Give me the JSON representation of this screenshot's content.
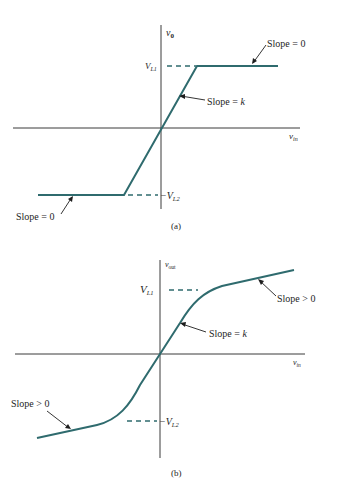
{
  "figure_a": {
    "caption": "(a)",
    "y_axis_label": "v",
    "y_axis_sub": "0",
    "x_axis_label": "v",
    "x_axis_sub": "in",
    "upper_limit_label": "V",
    "upper_limit_sub": "L1",
    "lower_limit_prefix": "−V",
    "lower_limit_sub": "L2",
    "annotations": {
      "top_right": "Slope = 0",
      "middle": "Slope = ",
      "middle_var": "k",
      "bottom_left": "Slope = 0"
    }
  },
  "figure_b": {
    "caption": "(b)",
    "y_axis_label": "v",
    "y_axis_sub": "out",
    "x_axis_label": "v",
    "x_axis_sub": "in",
    "upper_limit_label": "V",
    "upper_limit_sub": "L1",
    "lower_limit_prefix": "−V",
    "lower_limit_sub": "L2",
    "annotations": {
      "top_right": "Slope > 0",
      "middle": "Slope = ",
      "middle_var": "k",
      "bottom_left": "Slope > 0"
    }
  },
  "colors": {
    "curve": "#2f6b6e",
    "axis": "#3a3a3a",
    "text": "#1e1e1e"
  }
}
